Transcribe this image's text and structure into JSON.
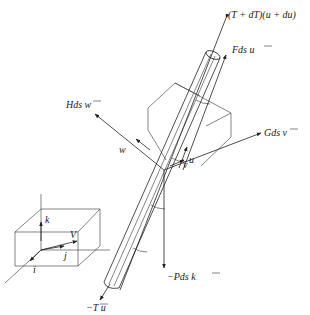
{
  "diagram": {
    "title": "",
    "labels": {
      "top_force": "(T + dT)(u + du)",
      "fds": "Fds u",
      "hds": "Hds w",
      "gds": "Gds v",
      "pds": "−Pds k",
      "bottom_force": "−T u",
      "u_vec": "u",
      "v_vec": "v",
      "w_vec": "w",
      "k_vec": "k",
      "i_vec": "i",
      "j_vec": "j",
      "V_vec": "V"
    },
    "nodes": [
      {
        "id": "cable",
        "label": "cable element (cylinder)"
      },
      {
        "id": "local-frame",
        "label": "local frame u, v, w"
      },
      {
        "id": "global-frame",
        "label": "global frame i, j, k with velocity V"
      }
    ],
    "edges": [
      {
        "from": "cable",
        "to": "top",
        "label": "(T + dT)(u + du)"
      },
      {
        "from": "cable",
        "to": "tangential",
        "label": "Fds u"
      },
      {
        "from": "cable",
        "to": "normal-w",
        "label": "Hds w"
      },
      {
        "from": "cable",
        "to": "normal-v",
        "label": "Gds v"
      },
      {
        "from": "cable",
        "to": "weight",
        "label": "−Pds k"
      },
      {
        "from": "cable",
        "to": "bottom",
        "label": "−T u"
      }
    ]
  }
}
